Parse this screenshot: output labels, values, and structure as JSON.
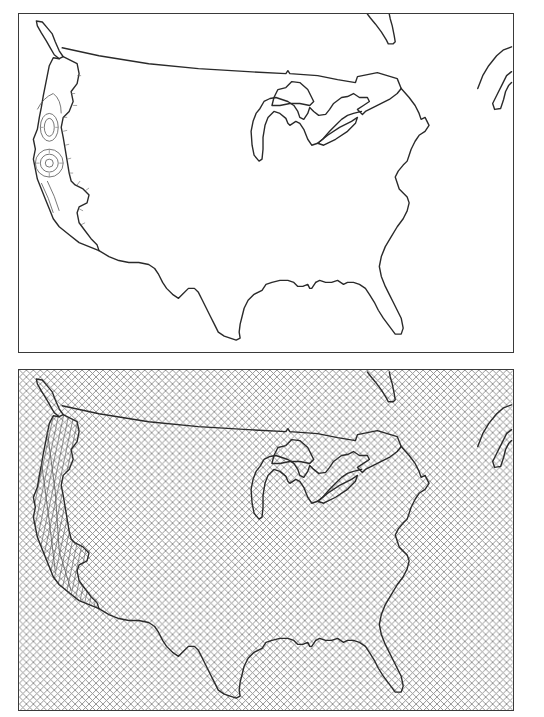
{
  "figure": {
    "panels": [
      {
        "id": "top",
        "label": "Contiguous United States outline map with contour detail along the Pacific coast",
        "fill_style": "none",
        "highlight_region": "Pacific coast (Washington, Oregon, California)",
        "highlight_style": "concentric contour lines with hachure ticks"
      },
      {
        "id": "bottom",
        "label": "Contiguous United States outline map with crosshatch fill covering the whole frame",
        "fill_style": "crosshatch",
        "highlight_region": "Pacific coast (Washington, Oregon, California)",
        "highlight_style": "denser diagonal hatching"
      }
    ],
    "colors": {
      "outline": "#2a2a2a",
      "frame": "#3a3a3a",
      "hatch": "#8a8a8a",
      "background": "#ffffff"
    }
  }
}
